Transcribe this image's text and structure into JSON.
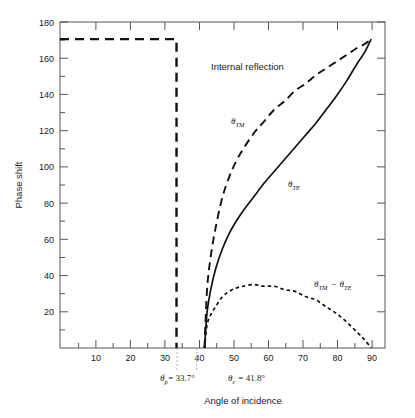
{
  "chart_data": {
    "type": "line",
    "title": "",
    "xlabel": "Angle of incidence",
    "ylabel": "Phase shift",
    "xlim": [
      0,
      94
    ],
    "ylim": [
      0,
      190
    ],
    "xticks": [
      10,
      20,
      30,
      40,
      50,
      60,
      70,
      80,
      90
    ],
    "yticks": [
      20,
      40,
      60,
      80,
      100,
      120,
      140,
      160,
      180
    ],
    "xminor_step": 5,
    "yminor_step": 10,
    "grid": false,
    "legend": "inline-curve-labels",
    "annotations": [
      {
        "id": "internal-reflection",
        "text": "Internal reflection",
        "x": 47,
        "y": 157
      },
      {
        "id": "brewster-marker",
        "text": "θ′p = 33.7°",
        "value": 33.7
      },
      {
        "id": "critical-marker",
        "text": "θc = 41.8°",
        "value": 41.8
      }
    ],
    "series": [
      {
        "name": "θ_TM",
        "label": "θTM",
        "style": "dashed",
        "x": [
          41.8,
          42.5,
          43.5,
          45,
          47,
          49,
          51,
          53,
          56,
          59,
          62,
          65,
          68,
          71,
          74,
          77,
          80,
          83,
          86,
          88,
          90
        ],
        "y": [
          0,
          33,
          52,
          70,
          88,
          100,
          109,
          116,
          125,
          132,
          139,
          144,
          150,
          154,
          159,
          163,
          167,
          171,
          175,
          177,
          180
        ]
      },
      {
        "name": "θ_TE",
        "label": "θTE",
        "style": "solid",
        "x": [
          41.8,
          42.5,
          43.5,
          45,
          47,
          49,
          51,
          53,
          56,
          59,
          62,
          65,
          68,
          71,
          74,
          77,
          80,
          83,
          86,
          88,
          90
        ],
        "y": [
          0,
          20,
          33,
          46,
          58,
          67,
          74,
          80,
          88,
          96,
          103,
          110,
          117,
          124,
          131,
          139,
          147,
          156,
          166,
          172,
          180
        ]
      },
      {
        "name": "θ_TM − θ_TE",
        "label": "θTM − θTE",
        "style": "dotted",
        "x": [
          41.8,
          42.5,
          43.5,
          45,
          47,
          49,
          51,
          53,
          56,
          59,
          62,
          65,
          68,
          71,
          74,
          77,
          80,
          83,
          86,
          88,
          90
        ],
        "y": [
          0,
          13,
          19,
          24,
          30,
          33,
          35,
          36,
          37,
          36,
          36,
          34,
          33,
          30,
          28,
          24,
          20,
          15,
          9,
          5,
          0
        ]
      },
      {
        "name": "180-degree plateau",
        "label": "",
        "style": "dashed-heavy",
        "x": [
          0,
          33.7,
          33.7
        ],
        "y": [
          180,
          180,
          0
        ]
      }
    ],
    "curve_label_positions": [
      {
        "series": "θ_TM",
        "x": 50.5,
        "y": 112
      },
      {
        "series": "θ_TE",
        "x": 64,
        "y": 82
      },
      {
        "series": "θ_TM − θ_TE",
        "x": 71,
        "y": 41
      }
    ]
  },
  "axes": {
    "ylabel": "Phase shift",
    "xlabel": "Angle of incidence",
    "ytick_labels": [
      "20",
      "40",
      "60",
      "80",
      "100",
      "120",
      "140",
      "160",
      "180"
    ],
    "xtick_labels": [
      "10",
      "20",
      "30",
      "40",
      "50",
      "60",
      "70",
      "80",
      "90"
    ]
  },
  "labels": {
    "internal_reflection": "Internal reflection",
    "theta_tm": "θ",
    "theta_tm_sub": "TM",
    "theta_te": "θ",
    "theta_te_sub": "TE",
    "diff_theta1": "θ",
    "diff_sub1": "TM",
    "diff_minus": "−",
    "diff_theta2": "θ",
    "diff_sub2": "TE",
    "brewster_theta": "θ",
    "brewster_prime": "′",
    "brewster_sub": "p",
    "brewster_eq": "= 33.7°",
    "critical_theta": "θ",
    "critical_sub": "c",
    "critical_eq": "= 41.8°"
  },
  "colors": {
    "ink": "#1a1a1a",
    "axis": "#555555",
    "background": "#ffffff"
  }
}
